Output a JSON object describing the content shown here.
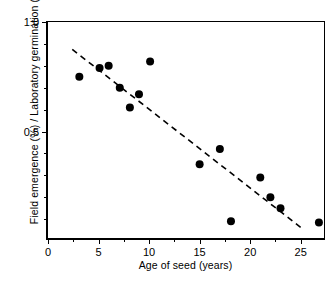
{
  "chart_data": {
    "type": "scatter",
    "title": "",
    "xlabel": "Age of seed (years)",
    "ylabel": "Field emergence (%)  /  Laboratory germination (%)",
    "xlim": [
      0,
      27.6
    ],
    "ylim": [
      0,
      1.0
    ],
    "grid": false,
    "legend": null,
    "xticks": [
      0,
      5,
      10,
      15,
      20,
      25
    ],
    "xticklabels": [
      "0",
      "5",
      "10",
      "15",
      "20",
      "25"
    ],
    "xminorticks": [
      2.5,
      7.5,
      12.5,
      17.5,
      22.5
    ],
    "yticks": [
      0.5,
      1.0
    ],
    "yticklabels": [
      "0.5",
      "1.0"
    ],
    "yminorticks": [
      0.1,
      0.2,
      0.3,
      0.4,
      0.6,
      0.7,
      0.8,
      0.9
    ],
    "marker": "filled-circle",
    "marker_color": "#000000",
    "marker_size": 8,
    "points": [
      {
        "x": 3.1,
        "y": 0.75
      },
      {
        "x": 5.1,
        "y": 0.79
      },
      {
        "x": 6.0,
        "y": 0.8
      },
      {
        "x": 7.1,
        "y": 0.7
      },
      {
        "x": 8.1,
        "y": 0.61
      },
      {
        "x": 9.0,
        "y": 0.67
      },
      {
        "x": 10.1,
        "y": 0.82
      },
      {
        "x": 15.0,
        "y": 0.35
      },
      {
        "x": 17.0,
        "y": 0.42
      },
      {
        "x": 18.1,
        "y": 0.09
      },
      {
        "x": 21.0,
        "y": 0.29
      },
      {
        "x": 22.0,
        "y": 0.2
      },
      {
        "x": 23.0,
        "y": 0.15
      },
      {
        "x": 26.8,
        "y": 0.085
      }
    ],
    "trendline": {
      "style": "dashed",
      "color": "#000000",
      "x0": 2.4,
      "y0": 0.875,
      "x1": 25.2,
      "y1": 0.055
    }
  },
  "caption": {
    "text": ""
  }
}
